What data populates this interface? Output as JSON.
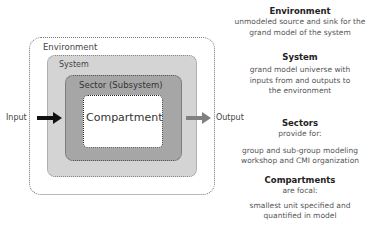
{
  "diagram": {
    "boxes": [
      {
        "id": "environment",
        "label": "Environment",
        "fill": "#ffffff",
        "border": "dotted"
      },
      {
        "id": "system",
        "label": "System",
        "fill": "#d4d4d4",
        "border": "dotted"
      },
      {
        "id": "sector",
        "label": "Sector (Subsystem)",
        "fill": "#a6a6a6",
        "border": "dotted"
      },
      {
        "id": "compartment",
        "label": "Compartment",
        "fill": "#ffffff",
        "border": "dotted"
      }
    ],
    "input_label": "Input",
    "output_label": "Output",
    "input_arrow_color": "#111111",
    "output_arrow_color": "#808080"
  },
  "legend": {
    "environment": {
      "heading": "Environment",
      "lines": [
        "unmodeled source and sink for the",
        "grand model of the system"
      ]
    },
    "system": {
      "heading": "System",
      "lines": [
        "grand model universe with",
        "inputs from and outputs to",
        "the environment"
      ]
    },
    "sectors": {
      "heading": "Sectors",
      "lines": [
        "provide for:",
        "",
        "group and sub-group modeling",
        "workshop and CMI organization"
      ]
    },
    "compartments": {
      "heading": "Compartments",
      "lines": [
        "are focal:",
        "",
        "smallest unit specified and",
        "quantified in model"
      ]
    }
  }
}
